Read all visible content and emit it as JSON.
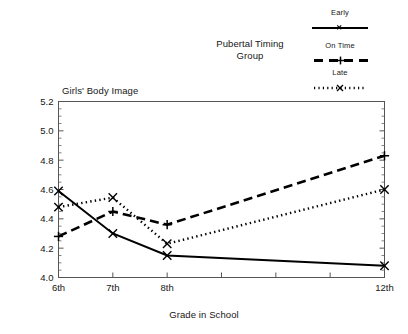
{
  "chart_data": {
    "type": "line",
    "title": "",
    "xlabel": "Grade in School",
    "ylabel": "Girls' Body Image",
    "legend_title": "Pubertal Timing Group",
    "legend_position": "top-right",
    "grid": false,
    "categories": [
      "6th",
      "7th",
      "8th",
      "12th"
    ],
    "x": [
      6,
      7,
      8,
      12
    ],
    "xlim": [
      6,
      12
    ],
    "ylim": [
      4.0,
      5.2
    ],
    "x_tick_labels": [
      "6th",
      "7th",
      "8th",
      "",
      "",
      "",
      "12th"
    ],
    "x_tick_values": [
      6,
      7,
      8,
      9,
      10,
      11,
      12
    ],
    "y_tick_labels": [
      "4.0",
      "4.2",
      "4.4",
      "4.6",
      "4.8",
      "5.0",
      "5.2"
    ],
    "y_tick_values": [
      4.0,
      4.2,
      4.4,
      4.6,
      4.8,
      5.0,
      5.2
    ],
    "y_minor_step": 0.05,
    "series": [
      {
        "name": "Early",
        "values": [
          4.59,
          4.3,
          4.15,
          4.08
        ],
        "line_style": "solid",
        "marker": "x",
        "color": "#000000"
      },
      {
        "name": "On Time",
        "values": [
          4.28,
          4.45,
          4.36,
          4.83
        ],
        "line_style": "dashed",
        "marker": "plus",
        "color": "#000000"
      },
      {
        "name": "Late",
        "values": [
          4.48,
          4.545,
          4.23,
          4.6
        ],
        "line_style": "dotted",
        "marker": "x",
        "color": "#000000"
      }
    ]
  },
  "legend": {
    "group_label_line1": "Pubertal Timing",
    "group_label_line2": "Group",
    "entries": [
      {
        "label": "Early"
      },
      {
        "label": "On Time"
      },
      {
        "label": "Late"
      }
    ]
  },
  "axes": {
    "y_title": "Girls' Body Image",
    "x_title": "Grade in School"
  },
  "colors": {
    "ink": "#000000",
    "text": "#161616",
    "frame": "#555555",
    "background": "#ffffff"
  }
}
